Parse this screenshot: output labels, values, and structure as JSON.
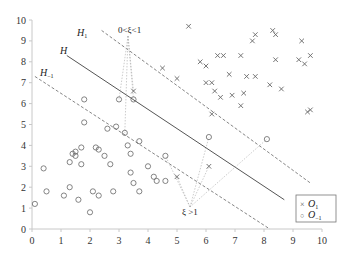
{
  "chart_data": {
    "type": "scatter",
    "title": "",
    "xlabel": "",
    "ylabel": "",
    "xlim": [
      0,
      10
    ],
    "ylim": [
      0,
      10
    ],
    "x_ticks": [
      "0",
      "1",
      "2",
      "3",
      "4",
      "5",
      "6",
      "7",
      "8",
      "9",
      "10"
    ],
    "y_ticks": [
      "0",
      "1",
      "2",
      "3",
      "4",
      "5",
      "6",
      "7",
      "8",
      "9",
      "10"
    ],
    "grid": false,
    "legend_position": "lower right",
    "series": [
      {
        "name": "O_1",
        "marker": "x",
        "points": [
          [
            5.4,
            9.7
          ],
          [
            7.6,
            9.0
          ],
          [
            7.7,
            9.3
          ],
          [
            8.3,
            9.5
          ],
          [
            8.4,
            9.3
          ],
          [
            5.8,
            8.0
          ],
          [
            6.0,
            7.8
          ],
          [
            7.2,
            8.3
          ],
          [
            8.4,
            8.1
          ],
          [
            9.6,
            8.3
          ],
          [
            9.3,
            9.0
          ],
          [
            9.2,
            8.1
          ],
          [
            9.4,
            7.9
          ],
          [
            4.5,
            7.7
          ],
          [
            5.0,
            7.2
          ],
          [
            6.4,
            8.3
          ],
          [
            6.6,
            8.3
          ],
          [
            6.0,
            7.0
          ],
          [
            6.2,
            7.0
          ],
          [
            6.8,
            7.4
          ],
          [
            7.4,
            7.3
          ],
          [
            7.7,
            7.3
          ],
          [
            8.6,
            6.7
          ],
          [
            8.2,
            6.9
          ],
          [
            7.3,
            6.5
          ],
          [
            6.3,
            6.6
          ],
          [
            6.5,
            6.3
          ],
          [
            6.9,
            6.4
          ],
          [
            7.2,
            5.9
          ],
          [
            6.2,
            5.5
          ],
          [
            9.6,
            5.7
          ],
          [
            9.5,
            5.6
          ],
          [
            3.5,
            6.6
          ],
          [
            5.0,
            2.5
          ],
          [
            6.1,
            3.0
          ]
        ]
      },
      {
        "name": "O_-1",
        "marker": "o",
        "points": [
          [
            0.1,
            1.2
          ],
          [
            0.4,
            2.9
          ],
          [
            0.5,
            1.8
          ],
          [
            1.1,
            1.6
          ],
          [
            1.3,
            2.0
          ],
          [
            1.3,
            3.2
          ],
          [
            1.4,
            3.6
          ],
          [
            1.5,
            3.5
          ],
          [
            1.5,
            3.7
          ],
          [
            1.6,
            1.4
          ],
          [
            1.7,
            3.9
          ],
          [
            1.7,
            3.1
          ],
          [
            1.8,
            5.1
          ],
          [
            2.0,
            0.8
          ],
          [
            2.1,
            1.8
          ],
          [
            2.2,
            3.9
          ],
          [
            2.3,
            3.8
          ],
          [
            2.3,
            1.6
          ],
          [
            2.5,
            3.5
          ],
          [
            2.6,
            4.8
          ],
          [
            2.7,
            3.1
          ],
          [
            2.8,
            1.8
          ],
          [
            2.9,
            4.9
          ],
          [
            3.0,
            6.2
          ],
          [
            3.2,
            4.6
          ],
          [
            3.3,
            4.0
          ],
          [
            3.4,
            3.6
          ],
          [
            3.4,
            2.7
          ],
          [
            3.5,
            2.2
          ],
          [
            3.7,
            4.2
          ],
          [
            3.7,
            1.8
          ],
          [
            4.0,
            3.0
          ],
          [
            4.2,
            2.5
          ],
          [
            4.3,
            2.3
          ],
          [
            4.6,
            2.3
          ],
          [
            4.6,
            3.5
          ],
          [
            6.1,
            4.4
          ],
          [
            8.1,
            4.3
          ],
          [
            1.8,
            6.2
          ],
          [
            3.5,
            6.2
          ]
        ]
      }
    ],
    "lines": [
      {
        "name": "H",
        "style": "solid",
        "from": [
          1.2,
          8.3
        ],
        "to": [
          8.7,
          1.4
        ]
      },
      {
        "name": "H_1",
        "style": "dashed",
        "from": [
          2.4,
          9.5
        ],
        "to": [
          9.6,
          2.2
        ]
      },
      {
        "name": "H_-1",
        "style": "dashed",
        "from": [
          0.1,
          7.3
        ],
        "to": [
          8.2,
          0.0
        ]
      }
    ],
    "annotations": [
      {
        "text": "0<ξ<1",
        "pos": [
          3.6,
          9.5
        ]
      },
      {
        "text": "ξ >1",
        "pos": [
          5.5,
          0.9
        ]
      }
    ]
  },
  "labels": {
    "H": "H",
    "H1": "H",
    "H1_sub": "1",
    "Hm1": "H",
    "Hm1_sub": "−1",
    "ann_top": "0<ξ<1",
    "ann_bottom": "ξ >1",
    "legend_o1_marker": "×",
    "legend_o1": "O",
    "legend_o1_sub": "1",
    "legend_om1_marker": "○",
    "legend_om1": "O",
    "legend_om1_sub": "−1"
  }
}
